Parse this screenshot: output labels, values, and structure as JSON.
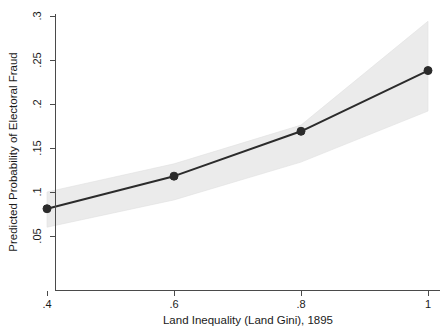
{
  "chart_data": {
    "type": "line",
    "title": "",
    "subtitle": "",
    "xlabel": "Land Inequality (Land Gini), 1895",
    "ylabel": "Predicted Probability of Electoral Fraud",
    "x": [
      0.4,
      0.6,
      0.8,
      1.0
    ],
    "xticklabels": [
      ".4",
      ".6",
      ".8",
      "1"
    ],
    "yticks": [
      0.05,
      0.1,
      0.15,
      0.2,
      0.25,
      0.3
    ],
    "yticklabels": [
      ".05",
      ".1",
      ".15",
      ".2",
      ".25",
      ".3"
    ],
    "xlim": [
      0.4,
      1.0
    ],
    "ylim": [
      0.042,
      0.305
    ],
    "grid": false,
    "legend": null,
    "series": [
      {
        "name": "Predicted probability",
        "values": [
          0.081,
          0.118,
          0.169,
          0.238
        ],
        "marker": "filled-circle",
        "color": "#2b2b2b"
      },
      {
        "name": "95% confidence interval (lower)",
        "values": [
          0.06,
          0.091,
          0.134,
          0.192
        ],
        "color": "#ebebeb"
      },
      {
        "name": "95% confidence interval (upper)",
        "values": [
          0.1,
          0.132,
          0.176,
          0.294
        ],
        "color": "#ebebeb"
      }
    ],
    "band_fill_color": "#ebebeb",
    "line_color": "#2b2b2b",
    "background_color": "#ffffff"
  },
  "axes": {
    "x_title": "Land Inequality (Land Gini), 1895",
    "y_title": "Predicted Probability of Electoral Fraud",
    "x_ticks": [
      {
        "label": ".4",
        "value": 0.4
      },
      {
        "label": ".6",
        "value": 0.6
      },
      {
        "label": ".8",
        "value": 0.8
      },
      {
        "label": "1",
        "value": 1.0
      }
    ],
    "y_ticks": [
      {
        "label": ".3",
        "value": 0.3
      },
      {
        "label": ".25",
        "value": 0.25
      },
      {
        "label": ".2",
        "value": 0.2
      },
      {
        "label": ".15",
        "value": 0.15
      },
      {
        "label": ".1",
        "value": 0.1
      },
      {
        "label": ".05",
        "value": 0.05
      }
    ]
  }
}
